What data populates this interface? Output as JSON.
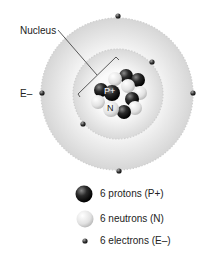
{
  "diagram": {
    "labels": {
      "nucleus": "Nucleus",
      "electron": "E–",
      "proton_tag": "P+",
      "neutron_tag": "N"
    }
  },
  "legend": [
    {
      "icon": "proton-ball",
      "label": "6 protons (P+)"
    },
    {
      "icon": "neutron-ball",
      "label": "6 neutrons (N)"
    },
    {
      "icon": "electron-dot",
      "label": "6 electrons (E–)"
    }
  ],
  "colors": {
    "proton": "#1a1a1a",
    "neutron": "#e6e6e6",
    "shell": "#e9e9e9"
  }
}
